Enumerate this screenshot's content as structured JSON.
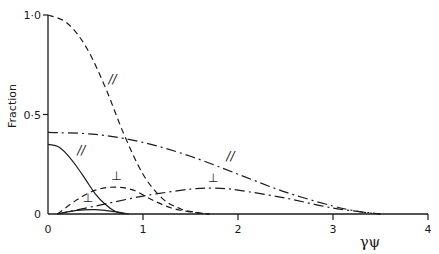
{
  "chart_data": {
    "type": "line",
    "title": "",
    "xlabel": "γψ",
    "ylabel": "Fraction",
    "xlim": [
      0,
      4
    ],
    "ylim": [
      0,
      1.0
    ],
    "xticks": [
      0,
      1,
      2,
      3,
      4
    ],
    "xtick_labels": [
      "0",
      "1",
      "2",
      "3",
      "4"
    ],
    "yticks": [
      0,
      0.5,
      1.0
    ],
    "ytick_labels": [
      "0",
      "0·5",
      "1·0"
    ],
    "grid": false,
    "legend": null,
    "series": [
      {
        "name": "dashed parallel",
        "style": "dashed",
        "annotation": "//",
        "x": [
          0,
          0.2,
          0.4,
          0.6,
          0.8,
          1.0,
          1.2,
          1.4,
          1.6,
          1.7
        ],
        "y": [
          1.0,
          0.96,
          0.84,
          0.64,
          0.4,
          0.2,
          0.08,
          0.025,
          0.005,
          0.0
        ]
      },
      {
        "name": "solid parallel",
        "style": "solid",
        "annotation": "//",
        "x": [
          0,
          0.1,
          0.2,
          0.3,
          0.4,
          0.5,
          0.6,
          0.7,
          0.8
        ],
        "y": [
          0.35,
          0.34,
          0.3,
          0.24,
          0.17,
          0.1,
          0.05,
          0.015,
          0.0
        ]
      },
      {
        "name": "dash-dot parallel",
        "style": "dashdot",
        "annotation": "//",
        "x": [
          0,
          0.5,
          1.0,
          1.5,
          2.0,
          2.5,
          3.0,
          3.3,
          3.5
        ],
        "y": [
          0.41,
          0.4,
          0.36,
          0.29,
          0.2,
          0.11,
          0.04,
          0.01,
          0.0
        ]
      },
      {
        "name": "dashed perpendicular",
        "style": "dashed",
        "annotation": "⊥",
        "x": [
          0.1,
          0.3,
          0.5,
          0.7,
          0.9,
          1.1,
          1.3,
          1.5,
          1.7
        ],
        "y": [
          0.0,
          0.07,
          0.12,
          0.135,
          0.12,
          0.07,
          0.03,
          0.01,
          0.0
        ]
      },
      {
        "name": "solid perpendicular",
        "style": "solid",
        "annotation": "⊥",
        "x": [
          0.1,
          0.3,
          0.5,
          0.7,
          0.85
        ],
        "y": [
          0.0,
          0.018,
          0.022,
          0.012,
          0.0
        ]
      },
      {
        "name": "dash-dot perpendicular",
        "style": "dashdot",
        "annotation": "⊥",
        "x": [
          0.1,
          0.5,
          1.0,
          1.5,
          1.75,
          2.0,
          2.5,
          3.0,
          3.5
        ],
        "y": [
          0.0,
          0.04,
          0.09,
          0.125,
          0.13,
          0.12,
          0.08,
          0.03,
          0.0
        ]
      }
    ],
    "annotations": [
      {
        "text": "//",
        "x": 0.68,
        "y": 0.66
      },
      {
        "text": "//",
        "x": 0.35,
        "y": 0.3
      },
      {
        "text": "//",
        "x": 1.92,
        "y": 0.27
      },
      {
        "text": "⊥",
        "x": 0.72,
        "y": 0.17
      },
      {
        "text": "⊥",
        "x": 0.42,
        "y": 0.06
      },
      {
        "text": "⊥",
        "x": 1.74,
        "y": 0.16
      }
    ]
  },
  "render": {
    "origin_px": [
      48,
      214
    ],
    "x_unit_px": 95,
    "y_unit_px": 199,
    "line_color": "#1a1a1a"
  }
}
